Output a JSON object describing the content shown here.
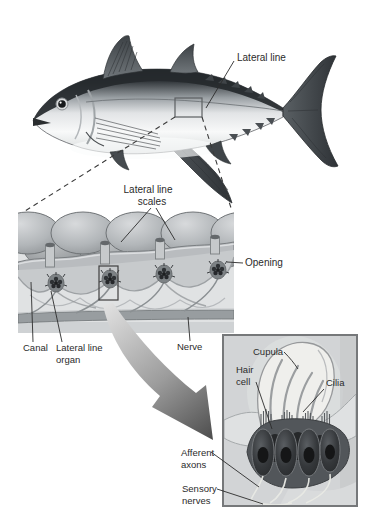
{
  "figure_type": "biology-diagram-lateral-line-system",
  "fish_panel": {
    "lateral_line": "Lateral line"
  },
  "scales_panel": {
    "scales_label_line1": "Lateral line",
    "scales_label_line2": "scales",
    "opening": "Opening",
    "canal": "Canal",
    "organ_line1": "Lateral line",
    "organ_line2": "organ",
    "nerve": "Nerve"
  },
  "inset_panel": {
    "cupula": "Cupula",
    "hair_line1": "Hair",
    "hair_line2": "cell",
    "cilia": "Cilia",
    "afferent_line1": "Afferent",
    "afferent_line2": "axons",
    "sensory_line1": "Sensory",
    "sensory_line2": "nerves"
  },
  "colors": {
    "background": "#ffffff",
    "label_text": "#2b2b2b",
    "leader_line": "#2b2b2b",
    "inset_frame_border": "#76787a",
    "inset_background": "#d2d4d6",
    "arrow_gradient_start": "#e3e3e3",
    "arrow_gradient_end": "#4c4c4c",
    "cupula_fill": "#efefec",
    "hair_cell_fill": "#313437"
  }
}
